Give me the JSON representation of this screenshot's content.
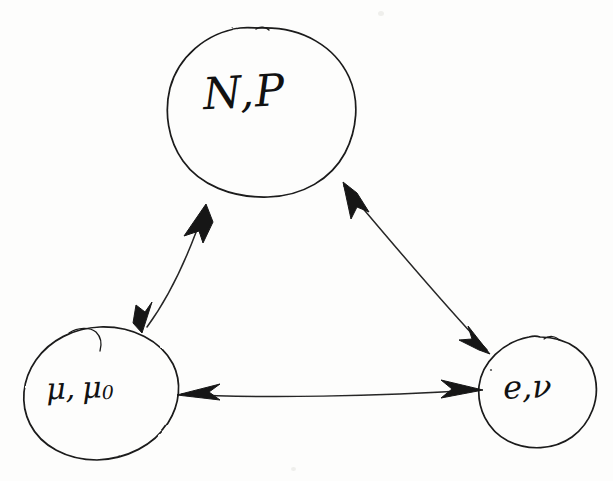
{
  "figure": {
    "kind": "hand-drawn-diagram",
    "background_color": "#fdfdfc",
    "ink_color": "#1a1a1a",
    "width": 613,
    "height": 481
  },
  "nodes": [
    {
      "id": "np",
      "label": "N,P",
      "label_plain": "N,P",
      "icon": "hand-drawn-circle",
      "position": "top",
      "center": {
        "x": 261,
        "y": 112
      },
      "radius": {
        "rx": 94,
        "ry": 85
      }
    },
    {
      "id": "mu",
      "label_main": "μ,",
      "label_second": "μ",
      "label_subscript": "0",
      "label_plain": "μ, μ₀",
      "icon": "hand-drawn-circle",
      "position": "bottom-left",
      "center": {
        "x": 101,
        "y": 393
      },
      "radius": {
        "rx": 77,
        "ry": 67
      }
    },
    {
      "id": "enu",
      "label": "e,ν",
      "label_plain": "e,ν",
      "icon": "hand-drawn-circle",
      "position": "bottom-right",
      "center": {
        "x": 537,
        "y": 392
      },
      "radius": {
        "rx": 59,
        "ry": 56
      }
    }
  ],
  "edges": [
    {
      "id": "edge-np-mu",
      "from": "np",
      "to": "mu",
      "icon": "double-headed-arrow",
      "direction": "bidirectional",
      "label": ""
    },
    {
      "id": "edge-np-enu",
      "from": "np",
      "to": "enu",
      "icon": "double-headed-arrow",
      "direction": "bidirectional",
      "label": ""
    },
    {
      "id": "edge-mu-enu",
      "from": "enu",
      "to": "mu",
      "icon": "double-headed-arrow",
      "direction": "bidirectional",
      "label": ""
    }
  ]
}
